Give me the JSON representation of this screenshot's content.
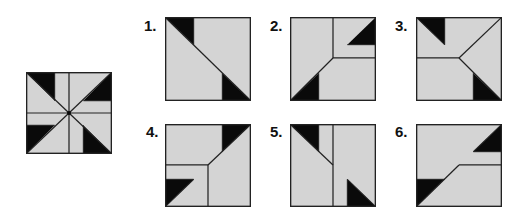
{
  "colors": {
    "fill": "#d4d4d4",
    "dark": "#0a0a0a",
    "stroke": "#222222",
    "background": "#ffffff"
  },
  "puzzle": {
    "reference": {
      "name": "pinwheel-square"
    },
    "options": [
      {
        "label": "1."
      },
      {
        "label": "2."
      },
      {
        "label": "3."
      },
      {
        "label": "4."
      },
      {
        "label": "5."
      },
      {
        "label": "6."
      }
    ]
  }
}
